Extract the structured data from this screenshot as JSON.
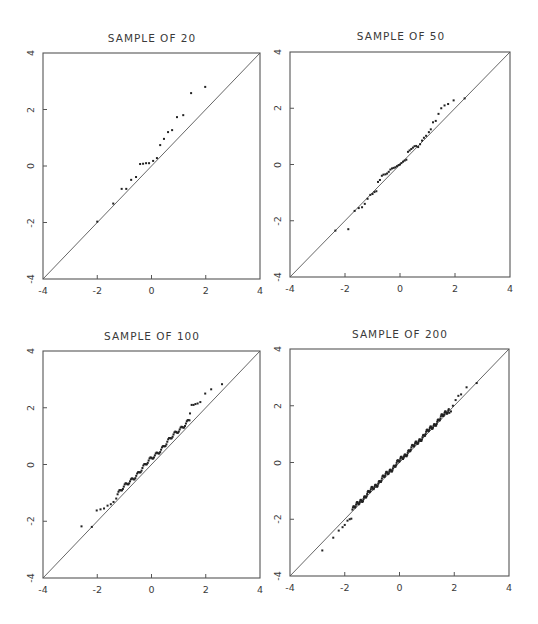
{
  "figure": {
    "panels": [
      {
        "title": "SAMPLE OF 20"
      },
      {
        "title": "SAMPLE OF 50"
      },
      {
        "title": "SAMPLE OF 100"
      },
      {
        "title": "SAMPLE OF 200"
      }
    ],
    "x_ticks": [
      "-4",
      "-2",
      "0",
      "2",
      "4"
    ],
    "y_ticks": [
      "-4",
      "-2",
      "0",
      "2",
      "4"
    ]
  },
  "chart_data": [
    {
      "type": "scatter",
      "title": "SAMPLE OF 20",
      "xlabel": "",
      "ylabel": "",
      "xlim": [
        -4,
        4
      ],
      "ylim": [
        -4,
        4
      ],
      "x_ticks": [
        -4,
        -2,
        0,
        2,
        4
      ],
      "y_ticks": [
        -4,
        -2,
        0,
        2,
        4
      ],
      "grid": false,
      "reference_line": "y = x",
      "points": [
        [
          -2.0,
          -1.97
        ],
        [
          -1.41,
          -1.33
        ],
        [
          -1.1,
          -0.81
        ],
        [
          -0.93,
          -0.81
        ],
        [
          -0.75,
          -0.49
        ],
        [
          -0.57,
          -0.39
        ],
        [
          -0.42,
          0.07
        ],
        [
          -0.31,
          0.08
        ],
        [
          -0.2,
          0.1
        ],
        [
          -0.09,
          0.1
        ],
        [
          0.06,
          0.18
        ],
        [
          0.2,
          0.28
        ],
        [
          0.32,
          0.74
        ],
        [
          0.46,
          0.96
        ],
        [
          0.61,
          1.2
        ],
        [
          0.76,
          1.27
        ],
        [
          0.94,
          1.73
        ],
        [
          1.17,
          1.8
        ],
        [
          1.46,
          2.58
        ],
        [
          1.98,
          2.8
        ]
      ]
    },
    {
      "type": "scatter",
      "title": "SAMPLE OF 50",
      "xlabel": "",
      "ylabel": "",
      "xlim": [
        -4,
        4
      ],
      "ylim": [
        -4,
        4
      ],
      "x_ticks": [
        -4,
        -2,
        0,
        2,
        4
      ],
      "y_ticks": [
        -4,
        -2,
        0,
        2,
        4
      ],
      "grid": false,
      "reference_line": "y = x",
      "points": [
        [
          -2.35,
          -2.35
        ],
        [
          -1.88,
          -2.3
        ],
        [
          -1.65,
          -1.65
        ],
        [
          -1.5,
          -1.55
        ],
        [
          -1.38,
          -1.52
        ],
        [
          -1.28,
          -1.4
        ],
        [
          -1.18,
          -1.22
        ],
        [
          -1.08,
          -1.08
        ],
        [
          -1.0,
          -1.05
        ],
        [
          -0.93,
          -0.98
        ],
        [
          -0.86,
          -0.95
        ],
        [
          -0.8,
          -0.62
        ],
        [
          -0.73,
          -0.55
        ],
        [
          -0.66,
          -0.4
        ],
        [
          -0.6,
          -0.36
        ],
        [
          -0.53,
          -0.35
        ],
        [
          -0.47,
          -0.32
        ],
        [
          -0.41,
          -0.26
        ],
        [
          -0.35,
          -0.18
        ],
        [
          -0.29,
          -0.14
        ],
        [
          -0.23,
          -0.12
        ],
        [
          -0.17,
          -0.1
        ],
        [
          -0.11,
          -0.06
        ],
        [
          -0.05,
          -0.02
        ],
        [
          0.0,
          0.0
        ],
        [
          0.05,
          0.05
        ],
        [
          0.11,
          0.1
        ],
        [
          0.17,
          0.14
        ],
        [
          0.23,
          0.17
        ],
        [
          0.29,
          0.45
        ],
        [
          0.35,
          0.5
        ],
        [
          0.41,
          0.55
        ],
        [
          0.47,
          0.6
        ],
        [
          0.53,
          0.65
        ],
        [
          0.59,
          0.66
        ],
        [
          0.66,
          0.62
        ],
        [
          0.73,
          0.72
        ],
        [
          0.8,
          0.85
        ],
        [
          0.87,
          0.95
        ],
        [
          0.95,
          1.02
        ],
        [
          1.05,
          1.15
        ],
        [
          1.12,
          1.25
        ],
        [
          1.2,
          1.5
        ],
        [
          1.3,
          1.55
        ],
        [
          1.4,
          1.8
        ],
        [
          1.5,
          2.0
        ],
        [
          1.62,
          2.1
        ],
        [
          1.75,
          2.15
        ],
        [
          1.95,
          2.28
        ],
        [
          2.35,
          2.35
        ]
      ]
    },
    {
      "type": "scatter",
      "title": "SAMPLE OF 100",
      "xlabel": "",
      "ylabel": "",
      "xlim": [
        -4,
        4
      ],
      "ylim": [
        -4,
        4
      ],
      "x_ticks": [
        -4,
        -2,
        0,
        2,
        4
      ],
      "y_ticks": [
        -4,
        -2,
        0,
        2,
        4
      ],
      "grid": false,
      "reference_line": "y = x",
      "tail_points": [
        [
          -2.58,
          -2.18
        ],
        [
          -2.2,
          -2.2
        ],
        [
          -2.02,
          -1.62
        ],
        [
          -1.88,
          -1.58
        ],
        [
          -1.75,
          -1.55
        ],
        [
          -1.62,
          -1.45
        ],
        [
          -1.5,
          -1.4
        ],
        [
          -1.4,
          -1.32
        ],
        [
          -1.3,
          -1.2
        ],
        [
          1.42,
          1.8
        ],
        [
          1.48,
          2.1
        ],
        [
          1.55,
          2.1
        ],
        [
          1.62,
          2.13
        ],
        [
          1.7,
          2.15
        ],
        [
          1.8,
          2.2
        ],
        [
          1.98,
          2.5
        ],
        [
          2.2,
          2.65
        ],
        [
          2.6,
          2.83
        ]
      ],
      "body_trend": {
        "x_range": [
          -1.25,
          1.4
        ],
        "offset": 0.2,
        "count": 82
      }
    },
    {
      "type": "scatter",
      "title": "SAMPLE OF 200",
      "xlabel": "",
      "ylabel": "",
      "xlim": [
        -4,
        4
      ],
      "ylim": [
        -4,
        4
      ],
      "x_ticks": [
        -4,
        -2,
        0,
        2,
        4
      ],
      "y_ticks": [
        -4,
        -2,
        0,
        2,
        4
      ],
      "grid": false,
      "reference_line": "y = x",
      "tail_points": [
        [
          -2.82,
          -3.1
        ],
        [
          -2.42,
          -2.65
        ],
        [
          -2.22,
          -2.4
        ],
        [
          -2.08,
          -2.28
        ],
        [
          -2.0,
          -2.2
        ],
        [
          -1.9,
          -2.05
        ],
        [
          -1.82,
          -2.0
        ],
        [
          -1.76,
          -1.98
        ],
        [
          1.82,
          1.75
        ],
        [
          1.88,
          1.8
        ],
        [
          1.95,
          2.0
        ],
        [
          2.05,
          2.2
        ],
        [
          2.15,
          2.35
        ],
        [
          2.25,
          2.4
        ],
        [
          2.45,
          2.65
        ],
        [
          2.82,
          2.8
        ]
      ],
      "body_trend": {
        "x_range": [
          -1.72,
          1.8
        ],
        "offset": 0.06,
        "count": 184
      }
    }
  ]
}
